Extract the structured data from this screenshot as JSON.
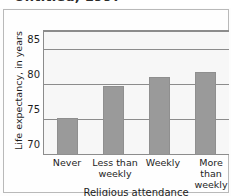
{
  "figure": {
    "partial_title": "Untitled, 1997",
    "background_color": "#fdfdfd",
    "frame_color": "#b9b9b9"
  },
  "chart_data": {
    "type": "bar",
    "title": "",
    "xlabel": "Religious attendance",
    "ylabel": "Life expectancy, in years",
    "categories": [
      "Never",
      "Less than weekly",
      "Weekly",
      "More than weekly"
    ],
    "category_lines": [
      [
        "Never"
      ],
      [
        "Less than",
        "weekly"
      ],
      [
        "Weekly"
      ],
      [
        "More than",
        "weekly"
      ]
    ],
    "values": [
      75.3,
      79.8,
      81.1,
      81.8
    ],
    "ylim": [
      70,
      87.5
    ],
    "yticks": [
      70,
      75,
      80,
      85
    ],
    "ytick_labels": [
      "70",
      "75",
      "80",
      "85"
    ],
    "gridlines": [
      75,
      80,
      85
    ],
    "grid": true,
    "legend": null,
    "bar_color": "#9a9a9a",
    "plot_background": "#f7f7f7",
    "axis_color": "#8c8c8c"
  }
}
